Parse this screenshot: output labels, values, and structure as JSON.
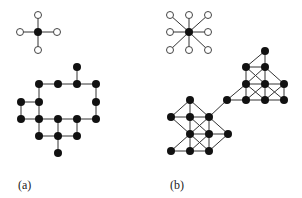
{
  "figure": {
    "panels": [
      {
        "id": "a",
        "label": "(a)",
        "label_pos": [
          18,
          189
        ],
        "star": {
          "center": [
            38,
            32
          ],
          "neighbors": [
            [
              38,
              15
            ],
            [
              38,
              50
            ],
            [
              20,
              32
            ],
            [
              57,
              32
            ]
          ],
          "description": "4-neighborhood (von Neumann)"
        },
        "graph": {
          "nodes": [
            [
              77,
              67
            ],
            [
              39,
              84
            ],
            [
              58,
              84
            ],
            [
              77,
              84
            ],
            [
              96,
              84
            ],
            [
              21,
              102
            ],
            [
              39,
              102
            ],
            [
              96,
              102
            ],
            [
              21,
              119
            ],
            [
              39,
              119
            ],
            [
              58,
              119
            ],
            [
              77,
              119
            ],
            [
              96,
              119
            ],
            [
              39,
              136
            ],
            [
              58,
              136
            ],
            [
              77,
              136
            ],
            [
              58,
              153
            ]
          ],
          "edges": [
            [
              [
                77,
                67
              ],
              [
                77,
                84
              ]
            ],
            [
              [
                39,
                84
              ],
              [
                58,
                84
              ]
            ],
            [
              [
                58,
                84
              ],
              [
                77,
                84
              ]
            ],
            [
              [
                77,
                84
              ],
              [
                96,
                84
              ]
            ],
            [
              [
                39,
                84
              ],
              [
                39,
                102
              ]
            ],
            [
              [
                96,
                84
              ],
              [
                96,
                102
              ]
            ],
            [
              [
                96,
                102
              ],
              [
                96,
                119
              ]
            ],
            [
              [
                21,
                102
              ],
              [
                39,
                102
              ]
            ],
            [
              [
                21,
                102
              ],
              [
                21,
                119
              ]
            ],
            [
              [
                39,
                102
              ],
              [
                39,
                119
              ]
            ],
            [
              [
                21,
                119
              ],
              [
                39,
                119
              ]
            ],
            [
              [
                39,
                119
              ],
              [
                58,
                119
              ]
            ],
            [
              [
                58,
                119
              ],
              [
                77,
                119
              ]
            ],
            [
              [
                77,
                119
              ],
              [
                96,
                119
              ]
            ],
            [
              [
                39,
                119
              ],
              [
                39,
                136
              ]
            ],
            [
              [
                58,
                119
              ],
              [
                58,
                136
              ]
            ],
            [
              [
                77,
                119
              ],
              [
                77,
                136
              ]
            ],
            [
              [
                39,
                136
              ],
              [
                58,
                136
              ]
            ],
            [
              [
                58,
                136
              ],
              [
                77,
                136
              ]
            ],
            [
              [
                58,
                136
              ],
              [
                58,
                153
              ]
            ]
          ]
        }
      },
      {
        "id": "b",
        "label": "(b)",
        "label_pos": [
          170,
          189
        ],
        "star": {
          "center": [
            189,
            32
          ],
          "neighbors": [
            [
              170,
              15
            ],
            [
              189,
              15
            ],
            [
              208,
              15
            ],
            [
              170,
              32
            ],
            [
              208,
              32
            ],
            [
              170,
              50
            ],
            [
              189,
              50
            ],
            [
              208,
              50
            ]
          ],
          "description": "8-neighborhood (Moore)"
        },
        "graph": {
          "nodes": [
            [
              265,
              51
            ],
            [
              246,
              67
            ],
            [
              265,
              67
            ],
            [
              246,
              84
            ],
            [
              265,
              84
            ],
            [
              284,
              84
            ],
            [
              227,
              100
            ],
            [
              246,
              100
            ],
            [
              265,
              100
            ],
            [
              284,
              100
            ],
            [
              190,
              100
            ],
            [
              171,
              117
            ],
            [
              190,
              117
            ],
            [
              209,
              117
            ],
            [
              190,
              134
            ],
            [
              209,
              134
            ],
            [
              228,
              134
            ],
            [
              171,
              151
            ],
            [
              190,
              151
            ],
            [
              209,
              151
            ]
          ],
          "edges": [
            [
              [
                265,
                51
              ],
              [
                246,
                67
              ]
            ],
            [
              [
                265,
                51
              ],
              [
                265,
                67
              ]
            ],
            [
              [
                246,
                67
              ],
              [
                265,
                67
              ]
            ],
            [
              [
                246,
                67
              ],
              [
                246,
                84
              ]
            ],
            [
              [
                265,
                67
              ],
              [
                265,
                84
              ]
            ],
            [
              [
                246,
                67
              ],
              [
                265,
                84
              ]
            ],
            [
              [
                265,
                67
              ],
              [
                246,
                84
              ]
            ],
            [
              [
                265,
                67
              ],
              [
                284,
                84
              ]
            ],
            [
              [
                246,
                84
              ],
              [
                265,
                84
              ]
            ],
            [
              [
                265,
                84
              ],
              [
                284,
                84
              ]
            ],
            [
              [
                246,
                84
              ],
              [
                246,
                100
              ]
            ],
            [
              [
                265,
                84
              ],
              [
                265,
                100
              ]
            ],
            [
              [
                284,
                84
              ],
              [
                284,
                100
              ]
            ],
            [
              [
                246,
                84
              ],
              [
                265,
                100
              ]
            ],
            [
              [
                265,
                84
              ],
              [
                246,
                100
              ]
            ],
            [
              [
                265,
                84
              ],
              [
                284,
                100
              ]
            ],
            [
              [
                284,
                84
              ],
              [
                265,
                100
              ]
            ],
            [
              [
                246,
                84
              ],
              [
                227,
                100
              ]
            ],
            [
              [
                227,
                100
              ],
              [
                246,
                100
              ]
            ],
            [
              [
                246,
                100
              ],
              [
                265,
                100
              ]
            ],
            [
              [
                265,
                100
              ],
              [
                284,
                100
              ]
            ],
            [
              [
                209,
                117
              ],
              [
                227,
                100
              ]
            ],
            [
              [
                190,
                100
              ],
              [
                171,
                117
              ]
            ],
            [
              [
                190,
                100
              ],
              [
                190,
                117
              ]
            ],
            [
              [
                190,
                100
              ],
              [
                209,
                117
              ]
            ],
            [
              [
                171,
                117
              ],
              [
                190,
                117
              ]
            ],
            [
              [
                190,
                117
              ],
              [
                209,
                117
              ]
            ],
            [
              [
                171,
                117
              ],
              [
                190,
                134
              ]
            ],
            [
              [
                190,
                117
              ],
              [
                190,
                134
              ]
            ],
            [
              [
                209,
                117
              ],
              [
                209,
                134
              ]
            ],
            [
              [
                190,
                117
              ],
              [
                209,
                134
              ]
            ],
            [
              [
                209,
                117
              ],
              [
                190,
                134
              ]
            ],
            [
              [
                209,
                117
              ],
              [
                228,
                134
              ]
            ],
            [
              [
                190,
                134
              ],
              [
                209,
                134
              ]
            ],
            [
              [
                209,
                134
              ],
              [
                228,
                134
              ]
            ],
            [
              [
                190,
                134
              ],
              [
                171,
                151
              ]
            ],
            [
              [
                190,
                134
              ],
              [
                190,
                151
              ]
            ],
            [
              [
                209,
                134
              ],
              [
                209,
                151
              ]
            ],
            [
              [
                190,
                134
              ],
              [
                209,
                151
              ]
            ],
            [
              [
                209,
                134
              ],
              [
                190,
                151
              ]
            ],
            [
              [
                228,
                134
              ],
              [
                209,
                151
              ]
            ],
            [
              [
                171,
                151
              ],
              [
                190,
                151
              ]
            ],
            [
              [
                190,
                151
              ],
              [
                209,
                151
              ]
            ]
          ]
        }
      }
    ],
    "style": {
      "filled_node_radius": 4,
      "open_node_radius": 3.5,
      "star_center_radius": 4
    }
  }
}
